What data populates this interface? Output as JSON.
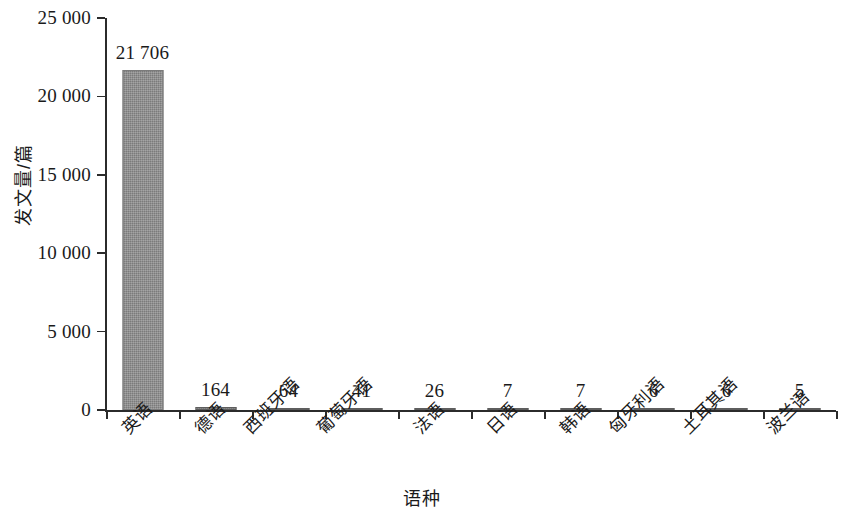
{
  "chart_data": {
    "type": "bar",
    "title": "",
    "subtitle": "",
    "xlabel": "语种",
    "ylabel": "发文量/篇",
    "categories": [
      "英语",
      "德语",
      "西班牙语",
      "葡萄牙语",
      "法语",
      "日语",
      "韩语",
      "匈牙利语",
      "土耳其语",
      "波兰语"
    ],
    "values": [
      21706,
      164,
      64,
      41,
      26,
      7,
      7,
      6,
      6,
      5
    ],
    "value_labels": [
      "21 706",
      "164",
      "64",
      "41",
      "26",
      "7",
      "7",
      "6",
      "6",
      "5"
    ],
    "ylim": [
      0,
      25000
    ],
    "ytick_values": [
      0,
      5000,
      10000,
      15000,
      20000,
      25000
    ],
    "ytick_labels": [
      "0",
      "5 000",
      "10 000",
      "15 000",
      "20 000",
      "25 000"
    ],
    "grid": false,
    "legend": false,
    "legend_position": "none",
    "series": [
      {
        "name": "发文量",
        "color": "#8d8d8d",
        "values": [
          21706,
          164,
          64,
          41,
          26,
          7,
          7,
          6,
          6,
          5
        ]
      }
    ],
    "bar_color": "#8d8d8d",
    "axis_color": "#2b2b2b",
    "background_color": "#ffffff"
  }
}
